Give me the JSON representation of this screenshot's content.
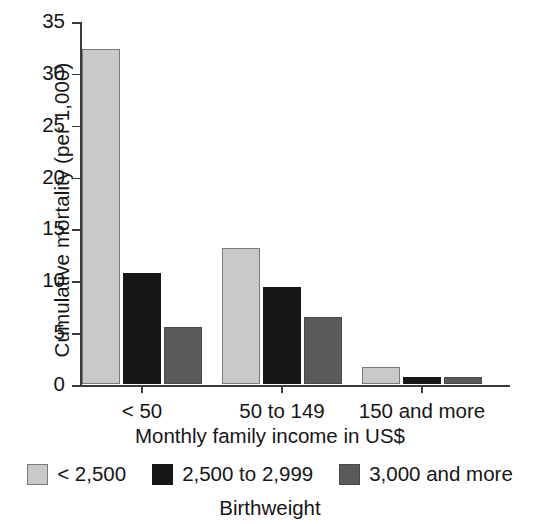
{
  "chart_data": {
    "type": "bar",
    "title": "",
    "subtitle": "",
    "xlabel": "Monthly family income in US$",
    "ylabel": "Cumulative mortality (per 1,000)",
    "categories": [
      "< 50",
      "50 to 149",
      "150 and more"
    ],
    "series": [
      {
        "name": "< 2,500",
        "color": "#c9c9c9",
        "values": [
          32.3,
          13.1,
          1.6
        ]
      },
      {
        "name": "2,500 to 2,999",
        "color": "#171717",
        "values": [
          10.7,
          9.4,
          0.7
        ]
      },
      {
        "name": "3,000 and more",
        "color": "#5a5a5a",
        "values": [
          5.5,
          6.5,
          0.7
        ]
      }
    ],
    "ylim": [
      0,
      35
    ],
    "yticks": [
      0,
      5,
      10,
      15,
      20,
      25,
      30,
      35
    ],
    "ytick_labels": [
      "0",
      "5",
      "10",
      "15",
      "20",
      "25",
      "30",
      "35"
    ],
    "grid": false,
    "legend_position": "bottom",
    "legend_title": "Birthweight"
  },
  "legend": {
    "title": "Birthweight",
    "entries": [
      {
        "label": "< 2,500"
      },
      {
        "label": "2,500 to 2,999"
      },
      {
        "label": "3,000 and more"
      }
    ]
  }
}
